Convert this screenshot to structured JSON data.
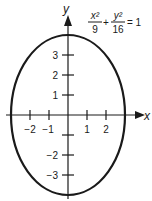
{
  "figure": {
    "type": "ellipse-graph",
    "equation": {
      "term1_num": "x²",
      "term1_den": "9",
      "plus": "+",
      "term2_num": "y²",
      "term2_den": "16",
      "rhs": "= 1"
    },
    "axes": {
      "x_label": "x",
      "y_label": "y",
      "x_ticks": [
        "−2",
        "−1",
        "1",
        "2"
      ],
      "y_ticks_pos": [
        "3",
        "2",
        "1"
      ],
      "y_ticks_neg": [
        "−2",
        "−3"
      ]
    },
    "ellipse": {
      "a": 3,
      "b": 4,
      "center": [
        0,
        0
      ]
    },
    "colors": {
      "stroke": "#1a1a1a",
      "background": "#ffffff"
    }
  }
}
